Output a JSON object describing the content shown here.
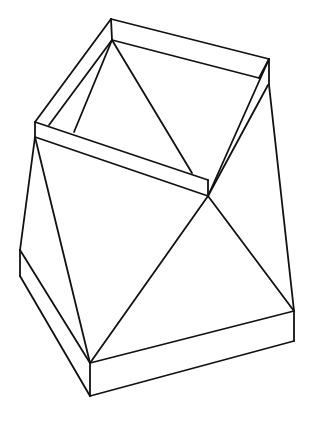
{
  "figure": {
    "title": "",
    "stroke_color": "#111111",
    "background": "#ffffff",
    "lines": [
      [
        111,
        19,
        269,
        59
      ],
      [
        111,
        19,
        35,
        122
      ],
      [
        269,
        59,
        208,
        196
      ],
      [
        35,
        122,
        208,
        180
      ],
      [
        111,
        19,
        112,
        40
      ],
      [
        112,
        40,
        259,
        78
      ],
      [
        112,
        40,
        49,
        125
      ],
      [
        112,
        40,
        74,
        132
      ],
      [
        112,
        40,
        192,
        173
      ],
      [
        269,
        59,
        269,
        85
      ],
      [
        208,
        180,
        208,
        196
      ],
      [
        35,
        122,
        35,
        137
      ],
      [
        35,
        137,
        208,
        196
      ],
      [
        208,
        196,
        268,
        85
      ],
      [
        269,
        59,
        259,
        78
      ],
      [
        35,
        137,
        20,
        250
      ],
      [
        35,
        137,
        90,
        363
      ],
      [
        208,
        196,
        90,
        363
      ],
      [
        208,
        196,
        294,
        311
      ],
      [
        269,
        85,
        294,
        311
      ],
      [
        20,
        250,
        20,
        276
      ],
      [
        20,
        250,
        90,
        363
      ],
      [
        20,
        276,
        90,
        396
      ],
      [
        90,
        363,
        90,
        396
      ],
      [
        90,
        363,
        294,
        311
      ],
      [
        90,
        396,
        294,
        341
      ],
      [
        294,
        311,
        294,
        341
      ]
    ]
  }
}
